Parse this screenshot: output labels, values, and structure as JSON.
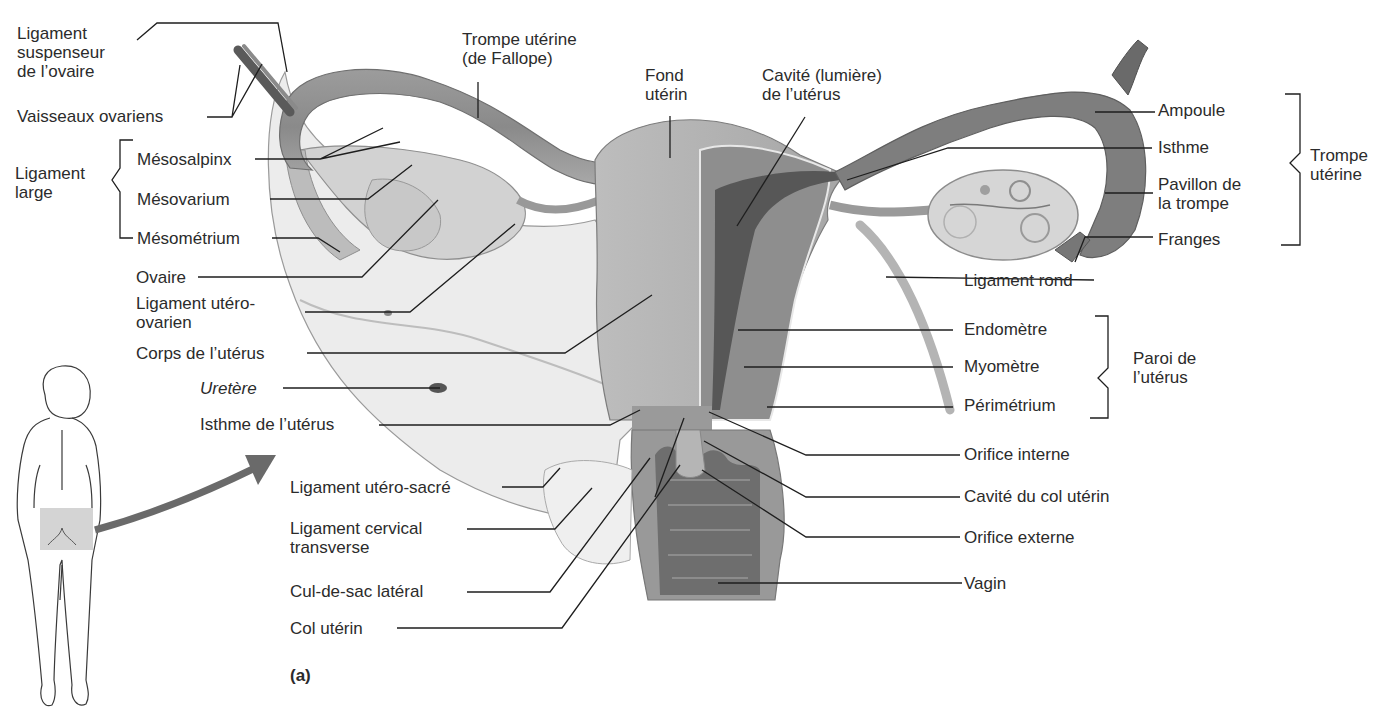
{
  "figure": {
    "panel_label": "(a)"
  },
  "labels_left": [
    {
      "id": "ligament-suspenseur",
      "lines": [
        "Ligament",
        "suspenseur",
        "de l’ovaire"
      ]
    },
    {
      "id": "vaisseaux-ovariens",
      "lines": [
        "Vaisseaux ovariens"
      ]
    },
    {
      "id": "ligament-large",
      "lines": [
        "Ligament",
        "large"
      ]
    },
    {
      "id": "mesosalpinx",
      "lines": [
        "Mésosalpinx"
      ]
    },
    {
      "id": "mesovarium",
      "lines": [
        "Mésovarium"
      ]
    },
    {
      "id": "mesometrium",
      "lines": [
        "Mésométrium"
      ]
    },
    {
      "id": "ovaire",
      "lines": [
        "Ovaire"
      ]
    },
    {
      "id": "ligament-utero-ovarien",
      "lines": [
        "Ligament utéro-",
        "ovarien"
      ]
    },
    {
      "id": "corps-uterus",
      "lines": [
        "Corps de l’utérus"
      ]
    },
    {
      "id": "uretere",
      "lines": [
        "Uretère"
      ],
      "italic": true
    },
    {
      "id": "isthme-uterus",
      "lines": [
        "Isthme de l’utérus"
      ]
    },
    {
      "id": "ligament-utero-sacre",
      "lines": [
        "Ligament utéro-sacré"
      ]
    },
    {
      "id": "ligament-cervical",
      "lines": [
        "Ligament cervical",
        "transverse"
      ]
    },
    {
      "id": "cul-de-sac",
      "lines": [
        "Cul-de-sac latéral"
      ]
    },
    {
      "id": "col-uterin",
      "lines": [
        "Col utérin"
      ]
    }
  ],
  "labels_top": [
    {
      "id": "trompe-fallope",
      "lines": [
        "Trompe utérine",
        "(de Fallope)"
      ]
    },
    {
      "id": "fond-uterin",
      "lines": [
        "Fond",
        "utérin"
      ]
    },
    {
      "id": "cavite-uterus",
      "lines": [
        "Cavité (lumière)",
        "de l’utérus"
      ]
    }
  ],
  "labels_right": [
    {
      "id": "ampoule",
      "lines": [
        "Ampoule"
      ]
    },
    {
      "id": "isthme",
      "lines": [
        "Isthme"
      ]
    },
    {
      "id": "pavillon",
      "lines": [
        "Pavillon de",
        "la trompe"
      ]
    },
    {
      "id": "franges",
      "lines": [
        "Franges"
      ]
    },
    {
      "id": "trompe-uterine-group",
      "lines": [
        "Trompe",
        "utérine"
      ]
    },
    {
      "id": "ligament-rond",
      "lines": [
        "Ligament rond"
      ]
    },
    {
      "id": "endometre",
      "lines": [
        "Endomètre"
      ]
    },
    {
      "id": "myometre",
      "lines": [
        "Myomètre"
      ]
    },
    {
      "id": "perimetrium",
      "lines": [
        "Périmétrium"
      ]
    },
    {
      "id": "paroi-uterus",
      "lines": [
        "Paroi de",
        "l’utérus"
      ]
    },
    {
      "id": "orifice-interne",
      "lines": [
        "Orifice interne"
      ]
    },
    {
      "id": "cavite-col",
      "lines": [
        "Cavité du col utérin"
      ]
    },
    {
      "id": "orifice-externe",
      "lines": [
        "Orifice externe"
      ]
    },
    {
      "id": "vagin",
      "lines": [
        "Vagin"
      ]
    }
  ],
  "colors": {
    "leader_line": "#1e1e1e",
    "tissue_light": "#d9d9d9",
    "tissue_mid": "#a9a9a9",
    "tissue_dark": "#6e6e6e",
    "tissue_darkest": "#4a4a4a",
    "highlight_box": "#cfcfcf",
    "arrow": "#6a6a6a"
  }
}
